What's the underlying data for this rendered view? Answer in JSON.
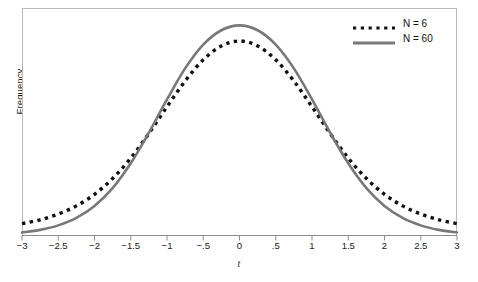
{
  "chart_data": {
    "type": "line",
    "title": "",
    "xlabel": "t",
    "ylabel": "Frequency",
    "xlim": [
      -3,
      3
    ],
    "ylim": [
      0,
      1.06
    ],
    "grid": false,
    "legend_position": "top-right",
    "x_ticks": [
      -3,
      -2.5,
      -2,
      -1.5,
      -1,
      -0.5,
      0,
      0.5,
      1,
      1.5,
      2,
      2.5,
      3
    ],
    "x_tick_labels": [
      "−3",
      "−2.5",
      "−2",
      "−1.5",
      "−1",
      "−.5",
      "0",
      ".5",
      "1",
      "1.5",
      "2",
      "2.5",
      "3"
    ],
    "y_tick_labels": [],
    "series": [
      {
        "name": "N = 6",
        "style": "dotted",
        "color": "#111111",
        "x": [
          -3,
          -2.75,
          -2.5,
          -2.25,
          -2,
          -1.75,
          -1.5,
          -1.25,
          -1,
          -0.75,
          -0.5,
          -0.25,
          0,
          0.25,
          0.5,
          0.75,
          1,
          1.25,
          1.5,
          1.75,
          2,
          2.25,
          2.5,
          2.75,
          3
        ],
        "values": [
          0.053,
          0.071,
          0.098,
          0.136,
          0.19,
          0.264,
          0.359,
          0.474,
          0.599,
          0.719,
          0.818,
          0.883,
          0.906,
          0.883,
          0.818,
          0.719,
          0.599,
          0.474,
          0.359,
          0.264,
          0.19,
          0.136,
          0.098,
          0.071,
          0.053
        ]
      },
      {
        "name": "N = 60",
        "style": "solid",
        "color": "#787878",
        "x": [
          -3,
          -2.75,
          -2.5,
          -2.25,
          -2,
          -1.75,
          -1.5,
          -1.25,
          -1,
          -0.75,
          -0.5,
          -0.25,
          0,
          0.25,
          0.5,
          0.75,
          1,
          1.25,
          1.5,
          1.75,
          2,
          2.25,
          2.5,
          2.75,
          3
        ],
        "values": [
          0.012,
          0.024,
          0.045,
          0.08,
          0.136,
          0.219,
          0.335,
          0.478,
          0.633,
          0.778,
          0.889,
          0.956,
          0.979,
          0.956,
          0.889,
          0.778,
          0.633,
          0.478,
          0.335,
          0.219,
          0.136,
          0.08,
          0.045,
          0.024,
          0.012
        ]
      }
    ],
    "annotations": []
  },
  "legend": {
    "items": [
      {
        "label": "N = 6",
        "sample": "dotted-line-sample"
      },
      {
        "label": "N = 60",
        "sample": "solid-line-sample"
      }
    ]
  },
  "axes": {
    "x_title": "t",
    "y_title": "Frequency"
  },
  "colors": {
    "dotted_series": "#111111",
    "solid_series": "#787878",
    "frame": "#b9b9b9",
    "axis": "#8c8c8c",
    "background": "#ffffff"
  }
}
